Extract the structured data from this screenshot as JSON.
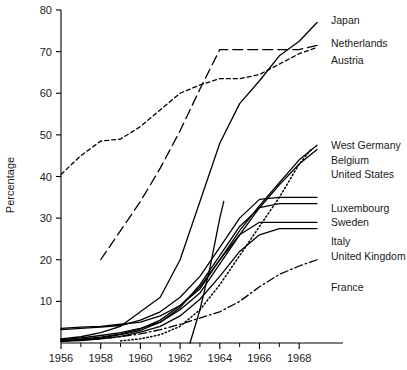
{
  "chart_data": {
    "type": "line",
    "title": "",
    "xlabel": "",
    "ylabel": "Percentage",
    "xlim": [
      1956,
      1969.3
    ],
    "ylim": [
      0,
      80
    ],
    "grid": false,
    "legend_position": "right-inline-labels",
    "x_ticks": [
      "1956",
      "1958",
      "1960",
      "1962",
      "1964",
      "1966",
      "1968"
    ],
    "x_tick_values": [
      1956,
      1958,
      1960,
      1962,
      1964,
      1966,
      1968
    ],
    "x_minor_tick_values": [
      1957,
      1959,
      1961,
      1963,
      1965,
      1967
    ],
    "y_ticks": [
      "10",
      "20",
      "30",
      "40",
      "50",
      "60",
      "70",
      "80"
    ],
    "y_tick_values": [
      10,
      20,
      30,
      40,
      50,
      60,
      70,
      80
    ],
    "series": [
      {
        "name": "Japan",
        "style": "solid",
        "label": "Japan",
        "label_x": 1969.6,
        "label_y": 77.5,
        "x": [
          1956,
          1957,
          1958,
          1959,
          1960,
          1961,
          1962,
          1963,
          1964,
          1965,
          1966,
          1967,
          1968,
          1968.9
        ],
        "y": [
          1.0,
          1.5,
          2.5,
          4.0,
          7.5,
          11.0,
          20.0,
          34.0,
          48.0,
          57.5,
          63.0,
          69.0,
          72.5,
          77.0
        ]
      },
      {
        "name": "Netherlands",
        "style": "dashed-short",
        "label": "Netherlands",
        "label_x": 1969.6,
        "label_y": 72.0,
        "x": [
          1956,
          1957,
          1958,
          1959,
          1960,
          1961,
          1962,
          1963,
          1964,
          1965,
          1966,
          1967,
          1968,
          1968.9
        ],
        "y": [
          40.5,
          45.0,
          48.5,
          49.0,
          52.0,
          56.0,
          60.0,
          62.0,
          63.5,
          63.5,
          64.5,
          67.0,
          69.5,
          71.0
        ]
      },
      {
        "name": "Austria",
        "style": "dashed-long",
        "label": "Austria",
        "label_x": 1969.6,
        "label_y": 68.0,
        "x": [
          1958,
          1959,
          1960,
          1961,
          1962,
          1963,
          1964,
          1965,
          1966,
          1967,
          1968,
          1968.9
        ],
        "y": [
          20.0,
          27.0,
          34.0,
          42.0,
          51.0,
          61.0,
          70.5,
          70.5,
          70.5,
          70.5,
          70.5,
          71.5
        ]
      },
      {
        "name": "West Germany",
        "style": "solid",
        "label": "West Germany",
        "label_x": 1969.6,
        "label_y": 47.5,
        "x": [
          1956,
          1957,
          1958,
          1959,
          1960,
          1961,
          1962,
          1963,
          1964,
          1965,
          1966,
          1967,
          1968,
          1968.9
        ],
        "y": [
          3.5,
          3.8,
          4.0,
          4.5,
          5.0,
          6.5,
          9.0,
          13.0,
          20.0,
          27.0,
          33.0,
          38.5,
          44.0,
          47.5
        ]
      },
      {
        "name": "Belgium",
        "style": "solid",
        "label": "Belgium",
        "label_x": 1969.6,
        "label_y": 44.0,
        "x": [
          1956,
          1957,
          1958,
          1959,
          1960,
          1961,
          1962,
          1963,
          1964,
          1965,
          1966,
          1967,
          1968,
          1968.9
        ],
        "y": [
          0.8,
          1.2,
          1.8,
          2.5,
          3.5,
          5.0,
          8.0,
          12.0,
          19.0,
          26.0,
          32.5,
          38.0,
          43.0,
          46.5
        ]
      },
      {
        "name": "United States",
        "style": "dotted",
        "label": "United States",
        "label_x": 1969.6,
        "label_y": 40.5,
        "x": [
          1959,
          1960,
          1961,
          1962,
          1963,
          1964,
          1965,
          1966,
          1967,
          1968,
          1968.6
        ],
        "y": [
          0.5,
          1.0,
          2.0,
          4.0,
          8.0,
          14.0,
          21.0,
          28.0,
          35.0,
          43.0,
          46.5
        ]
      },
      {
        "name": "Luxembourg",
        "style": "solid",
        "label": "Luxembourg",
        "label_x": 1969.6,
        "label_y": 32.5,
        "x": [
          1956,
          1957,
          1958,
          1959,
          1960,
          1961,
          1962,
          1963,
          1964,
          1965,
          1966,
          1967,
          1968,
          1968.9
        ],
        "y": [
          3.2,
          3.5,
          3.8,
          4.2,
          5.5,
          7.5,
          11.0,
          16.0,
          23.0,
          30.0,
          34.5,
          35.0,
          35.0,
          35.0
        ]
      },
      {
        "name": "Sweden",
        "style": "solid",
        "label": "Sweden",
        "label_x": 1969.6,
        "label_y": 29.0,
        "x": [
          1956,
          1957,
          1958,
          1959,
          1960,
          1961,
          1962,
          1963,
          1964,
          1965,
          1966,
          1967,
          1968,
          1968.9
        ],
        "y": [
          0.5,
          0.8,
          1.2,
          2.0,
          3.0,
          5.0,
          8.5,
          14.0,
          21.0,
          28.0,
          32.5,
          33.5,
          33.5,
          33.5
        ]
      },
      {
        "name": "Italy",
        "style": "solid",
        "label": "Italy",
        "label_x": 1969.6,
        "label_y": 24.5,
        "x": [
          1956,
          1957,
          1958,
          1959,
          1960,
          1961,
          1962,
          1963,
          1964,
          1965,
          1966,
          1967,
          1968,
          1968.9
        ],
        "y": [
          0.6,
          0.9,
          1.4,
          2.2,
          3.4,
          5.5,
          9.0,
          13.5,
          20.0,
          26.0,
          29.0,
          29.0,
          29.0,
          29.0
        ]
      },
      {
        "name": "United Kingdom",
        "style": "solid",
        "label": "United Kingdom",
        "label_x": 1969.6,
        "label_y": 21.0,
        "x": [
          1956,
          1957,
          1958,
          1959,
          1960,
          1961,
          1962,
          1963,
          1964,
          1965,
          1966,
          1967,
          1968,
          1968.9
        ],
        "y": [
          0.4,
          0.6,
          1.0,
          1.6,
          2.6,
          4.0,
          6.5,
          10.5,
          16.0,
          22.0,
          26.0,
          27.5,
          27.5,
          27.5
        ]
      },
      {
        "name": "France",
        "style": "dash-dot",
        "label": "France",
        "label_x": 1969.6,
        "label_y": 13.5,
        "x": [
          1956,
          1957,
          1958,
          1959,
          1960,
          1961,
          1962,
          1963,
          1964,
          1965,
          1966,
          1967,
          1968,
          1968.9
        ],
        "y": [
          0.5,
          0.7,
          1.0,
          1.5,
          2.2,
          3.2,
          4.5,
          6.0,
          7.5,
          10.0,
          13.5,
          16.5,
          18.5,
          20.0
        ]
      },
      {
        "name": "unlabeled-steep",
        "style": "solid",
        "label": "",
        "label_x": null,
        "label_y": null,
        "x": [
          1962.5,
          1963,
          1963.5,
          1964,
          1964.2
        ],
        "y": [
          0.0,
          8.0,
          18.0,
          30.0,
          34.0
        ]
      }
    ]
  },
  "axis": {
    "y_title": "Percentage"
  },
  "colors": {
    "line": "#000000",
    "axis": "#000000",
    "text": "#1a1a1a",
    "background": "#ffffff"
  }
}
